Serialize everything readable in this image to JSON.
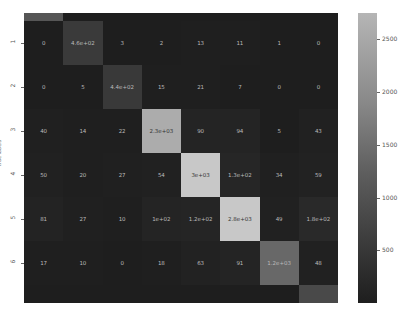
{
  "chart_data": {
    "type": "heatmap",
    "title": "",
    "xlabel": "",
    "ylabel": "true labels",
    "row_labels": [
      "1",
      "2",
      "3",
      "4",
      "5",
      "6"
    ],
    "visible_columns": 8,
    "matrix": [
      [
        "0",
        "4.6e+02",
        "3",
        "2",
        "13",
        "11",
        "1",
        "0"
      ],
      [
        "0",
        "5",
        "4.4e+02",
        "15",
        "21",
        "7",
        "0",
        "0"
      ],
      [
        "40",
        "14",
        "22",
        "2.3e+03",
        "90",
        "94",
        "5",
        "43"
      ],
      [
        "50",
        "20",
        "27",
        "54",
        "3e+03",
        "1.3e+02",
        "34",
        "59"
      ],
      [
        "81",
        "27",
        "10",
        "1e+02",
        "1.2e+02",
        "2.8e+03",
        "49",
        "1.8e+02"
      ],
      [
        "17",
        "10",
        "0",
        "18",
        "63",
        "91",
        "1.2e+03",
        "48"
      ]
    ],
    "values": [
      [
        0,
        460,
        3,
        2,
        13,
        11,
        1,
        0
      ],
      [
        0,
        5,
        440,
        15,
        21,
        7,
        0,
        0
      ],
      [
        40,
        14,
        22,
        2300,
        90,
        94,
        5,
        43
      ],
      [
        50,
        20,
        27,
        54,
        3000,
        130,
        34,
        59
      ],
      [
        81,
        27,
        10,
        100,
        120,
        2800,
        49,
        180
      ],
      [
        17,
        10,
        0,
        18,
        63,
        91,
        1200,
        48
      ]
    ],
    "partial_top_row_shade": [
      900,
      0,
      0,
      0,
      0,
      0,
      0,
      0
    ],
    "partial_bottom_row_shade": [
      0,
      0,
      0,
      0,
      0,
      0,
      0,
      700
    ],
    "colorbar": {
      "ticks": [
        500,
        1000,
        1500,
        2000,
        2500
      ],
      "range": [
        0,
        2750
      ],
      "cmap": "gray"
    }
  }
}
